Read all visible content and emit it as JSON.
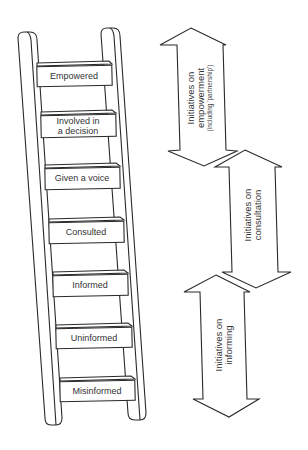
{
  "diagram": {
    "type": "ladder-of-participation",
    "ladder": {
      "rungs": [
        {
          "label_lines": [
            "Empowered"
          ]
        },
        {
          "label_lines": [
            "Involved in",
            "a decision"
          ]
        },
        {
          "label_lines": [
            "Given a voice"
          ]
        },
        {
          "label_lines": [
            "Consulted"
          ]
        },
        {
          "label_lines": [
            "Informed"
          ]
        },
        {
          "label_lines": [
            "Uninformed"
          ]
        },
        {
          "label_lines": [
            "Misinformed"
          ]
        }
      ]
    },
    "arrows": [
      {
        "name": "empowerment",
        "label_lines": [
          "Initiatives on",
          "empowerment"
        ],
        "sub_label": "(including 'partnership')"
      },
      {
        "name": "consultation",
        "label_lines": [
          "Initiatives on",
          "consultation"
        ]
      },
      {
        "name": "informing",
        "label_lines": [
          "Initiatives on",
          "informing"
        ]
      }
    ],
    "colors": {
      "stroke": "#2a2a2a",
      "background": "#ffffff",
      "text": "#333333"
    }
  }
}
